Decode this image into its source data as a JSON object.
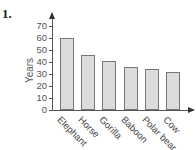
{
  "problem_number": "1.",
  "chart_data": {
    "type": "bar",
    "title": "",
    "xlabel": "",
    "ylabel": "Years",
    "categories": [
      "Elephant",
      "Horse",
      "Gorilla",
      "Baboon",
      "Polar bear",
      "Cow"
    ],
    "values": [
      60,
      46,
      41,
      36,
      34,
      32
    ],
    "ylim": [
      0,
      70
    ],
    "yticks": [
      0,
      10,
      20,
      30,
      40,
      50,
      60,
      70
    ],
    "grid": false,
    "legend": null,
    "bar_color": "#dcdcdc",
    "bar_edge_color": "#777777"
  }
}
